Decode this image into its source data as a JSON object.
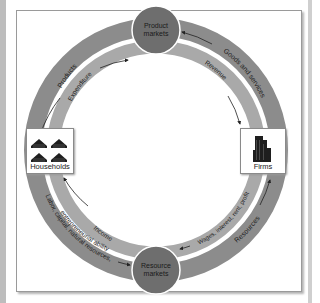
{
  "diagram": {
    "type": "circular-flow",
    "nodes": {
      "product_markets": "Product markets",
      "product_markets_line1": "Product",
      "product_markets_line2": "markets",
      "resource_markets": "Resource markets",
      "resource_markets_line1": "Resource",
      "resource_markets_line2": "markets",
      "households": "Households",
      "firms": "Firms"
    },
    "flows": {
      "products": "Products",
      "expenditure": "Expenditure",
      "goods_and_services": "Goods and services",
      "revenue": "Revenue",
      "income": "Income",
      "labor_capital": "Labor, capital, natural resources,",
      "entrepreneurial": "entrepreneurial ability",
      "wages": "Wages, interest, rent, profit",
      "resources": "Resources"
    },
    "colors": {
      "outer_ring": "#8c8c8c",
      "inner_ring": "#a9a9a9",
      "market_circle": "#6e6e6e",
      "background": "#ffffff",
      "text": "#222222"
    },
    "icons": {
      "households": "houses-icon",
      "firms": "office-building-icon"
    }
  }
}
